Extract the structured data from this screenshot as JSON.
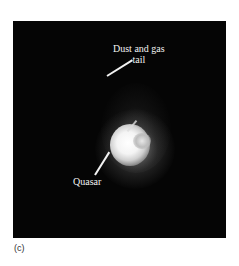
{
  "figure": {
    "panel_label": "(c)",
    "annotations": {
      "tail_line1": "Dust and gas",
      "tail_line2": "tail",
      "quasar": "Quasar"
    },
    "colors": {
      "background": "#ffffff",
      "photo_background": "#050505",
      "label_text": "#f2f2f2"
    }
  }
}
